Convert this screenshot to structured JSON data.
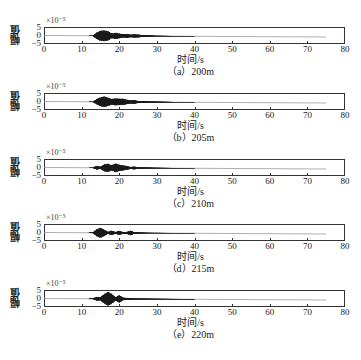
{
  "chart_data": [
    {
      "type": "line",
      "title": "(a) 200m",
      "xlabel": "时间/s",
      "ylabel": "幅值",
      "y_exponent": "×10⁻⁵",
      "xlim": [
        0,
        80
      ],
      "ylim": [
        -5,
        5
      ],
      "x_ticks": [
        0,
        10,
        20,
        30,
        40,
        50,
        60,
        70,
        80
      ],
      "y_ticks": [
        5,
        0,
        -5
      ],
      "signal_end_s": 75,
      "envelope": [
        [
          0,
          0.05
        ],
        [
          13,
          0.1
        ],
        [
          14,
          2.0
        ],
        [
          15,
          3.2
        ],
        [
          16,
          3.4
        ],
        [
          17,
          3.0
        ],
        [
          18,
          1.4
        ],
        [
          19,
          2.0
        ],
        [
          20,
          1.5
        ],
        [
          21,
          1.0
        ],
        [
          22,
          1.2
        ],
        [
          23,
          0.8
        ],
        [
          24,
          1.0
        ],
        [
          25,
          0.9
        ],
        [
          26,
          0.6
        ],
        [
          28,
          0.4
        ],
        [
          30,
          0.2
        ],
        [
          35,
          0.1
        ],
        [
          75,
          0.05
        ]
      ]
    },
    {
      "type": "line",
      "title": "(b) 205m",
      "xlabel": "时间/s",
      "ylabel": "幅值",
      "y_exponent": "×10⁻⁵",
      "xlim": [
        0,
        80
      ],
      "ylim": [
        -5,
        5
      ],
      "x_ticks": [
        0,
        10,
        20,
        30,
        40,
        50,
        60,
        70,
        80
      ],
      "y_ticks": [
        5,
        0,
        -5
      ],
      "signal_end_s": 75,
      "envelope": [
        [
          0,
          0.05
        ],
        [
          13,
          0.1
        ],
        [
          14,
          1.6
        ],
        [
          15,
          2.8
        ],
        [
          16,
          3.4
        ],
        [
          17,
          2.6
        ],
        [
          18,
          1.8
        ],
        [
          19,
          2.2
        ],
        [
          20,
          2.0
        ],
        [
          21,
          2.0
        ],
        [
          22,
          1.4
        ],
        [
          23,
          1.0
        ],
        [
          24,
          1.2
        ],
        [
          25,
          0.6
        ],
        [
          27,
          0.5
        ],
        [
          30,
          0.3
        ],
        [
          35,
          0.1
        ],
        [
          75,
          0.05
        ]
      ]
    },
    {
      "type": "line",
      "title": "(c) 210m",
      "xlabel": "时间/s",
      "ylabel": "幅值",
      "y_exponent": "×10⁻⁵",
      "xlim": [
        0,
        80
      ],
      "ylim": [
        -5,
        5
      ],
      "x_ticks": [
        0,
        10,
        20,
        30,
        40,
        50,
        60,
        70,
        80
      ],
      "y_ticks": [
        5,
        0,
        -5
      ],
      "signal_end_s": 75,
      "envelope": [
        [
          0,
          0.05
        ],
        [
          13,
          0.1
        ],
        [
          14,
          1.2
        ],
        [
          15,
          0.6
        ],
        [
          16,
          2.2
        ],
        [
          17,
          2.6
        ],
        [
          18,
          1.6
        ],
        [
          19,
          2.8
        ],
        [
          20,
          2.0
        ],
        [
          21,
          1.6
        ],
        [
          22,
          1.2
        ],
        [
          23,
          0.6
        ],
        [
          24,
          0.9
        ],
        [
          25,
          0.4
        ],
        [
          28,
          0.3
        ],
        [
          30,
          0.2
        ],
        [
          35,
          0.1
        ],
        [
          75,
          0.05
        ]
      ]
    },
    {
      "type": "line",
      "title": "(d) 215m",
      "xlabel": "时间/s",
      "ylabel": "幅值",
      "y_exponent": "×10⁻⁵",
      "xlim": [
        0,
        80
      ],
      "ylim": [
        -5,
        5
      ],
      "x_ticks": [
        0,
        10,
        20,
        30,
        40,
        50,
        60,
        70,
        80
      ],
      "y_ticks": [
        5,
        0,
        -5
      ],
      "signal_end_s": 75,
      "envelope": [
        [
          0,
          0.05
        ],
        [
          13,
          0.2
        ],
        [
          14,
          2.2
        ],
        [
          15,
          3.2
        ],
        [
          16,
          2.0
        ],
        [
          17,
          0.6
        ],
        [
          18,
          1.4
        ],
        [
          19,
          0.5
        ],
        [
          20,
          1.3
        ],
        [
          21,
          0.5
        ],
        [
          22,
          0.6
        ],
        [
          23,
          1.4
        ],
        [
          24,
          0.5
        ],
        [
          26,
          0.3
        ],
        [
          28,
          0.15
        ],
        [
          35,
          0.1
        ],
        [
          75,
          0.05
        ]
      ]
    },
    {
      "type": "line",
      "title": "(e) 220m",
      "xlabel": "时间/s",
      "ylabel": "幅值",
      "y_exponent": "×10⁻⁵",
      "xlim": [
        0,
        80
      ],
      "ylim": [
        -5,
        5
      ],
      "x_ticks": [
        0,
        10,
        20,
        30,
        40,
        50,
        60,
        70,
        80
      ],
      "y_ticks": [
        5,
        0,
        -5
      ],
      "signal_end_s": 75,
      "envelope": [
        [
          0,
          0.05
        ],
        [
          13,
          0.2
        ],
        [
          14,
          1.2
        ],
        [
          15,
          1.0
        ],
        [
          16,
          3.0
        ],
        [
          17,
          4.4
        ],
        [
          18,
          3.2
        ],
        [
          19,
          1.0
        ],
        [
          20,
          2.4
        ],
        [
          21,
          0.8
        ],
        [
          22,
          0.6
        ],
        [
          23,
          0.4
        ],
        [
          25,
          0.3
        ],
        [
          30,
          0.2
        ],
        [
          35,
          0.15
        ],
        [
          75,
          0.05
        ]
      ]
    }
  ],
  "panels": [
    {
      "caption": "（a）200m",
      "xlabel": "时间/s",
      "ylabel": "幅值",
      "exp": "×10⁻⁵"
    },
    {
      "caption": "（b）205m",
      "xlabel": "时间/s",
      "ylabel": "幅值",
      "exp": "×10⁻⁵"
    },
    {
      "caption": "（c）210m",
      "xlabel": "时间/s",
      "ylabel": "幅值",
      "exp": "×10⁻⁵"
    },
    {
      "caption": "（d）215m",
      "xlabel": "时间/s",
      "ylabel": "幅值",
      "exp": "×10⁻⁵"
    },
    {
      "caption": "（e）220m",
      "xlabel": "时间/s",
      "ylabel": "幅值",
      "exp": "×10⁻⁵"
    }
  ],
  "axis": {
    "x_ticks": [
      "0",
      "10",
      "20",
      "30",
      "40",
      "50",
      "60",
      "70",
      "80"
    ],
    "y_ticks": [
      "5",
      "0",
      "−5"
    ]
  },
  "colors": {
    "signal": "#1a1a1a",
    "frame": "#333333",
    "baseline": "#999999"
  }
}
